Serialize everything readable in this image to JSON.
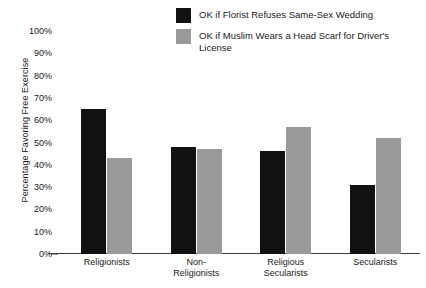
{
  "chart_data": {
    "type": "bar",
    "title": "",
    "xlabel": "",
    "ylabel": "Percentage Favoring Free Exercise",
    "ylim": [
      0,
      100
    ],
    "ytick_labels": [
      "100%",
      "90%",
      "80%",
      "70%",
      "60%",
      "50%",
      "40%",
      "30%",
      "20%",
      "10%",
      "0%"
    ],
    "ytick_values": [
      100,
      90,
      80,
      70,
      60,
      50,
      40,
      30,
      20,
      10,
      0
    ],
    "grid": false,
    "legend_position": "top-center",
    "categories": [
      "Religionists",
      "Non-Religionists",
      "Religious Secularists",
      "Secularists"
    ],
    "category_lines": [
      [
        "Religionists"
      ],
      [
        "Non-",
        "Religionists"
      ],
      [
        "Religious",
        "Secularists"
      ],
      [
        "Secularists"
      ]
    ],
    "series": [
      {
        "name": "OK if Florist Refuses Same-Sex Wedding",
        "color": "#111111",
        "values": [
          65,
          48,
          46,
          31
        ]
      },
      {
        "name": "OK if Muslim Wears a Head Scarf for Driver's License",
        "color": "#9a9a9a",
        "values": [
          43,
          47,
          57,
          52
        ]
      }
    ]
  },
  "legend": {
    "items": [
      {
        "label": "OK if Florist Refuses Same-Sex Wedding",
        "color": "#111111"
      },
      {
        "label": "OK if Muslim Wears a Head Scarf for Driver's License",
        "color": "#9a9a9a"
      }
    ]
  }
}
